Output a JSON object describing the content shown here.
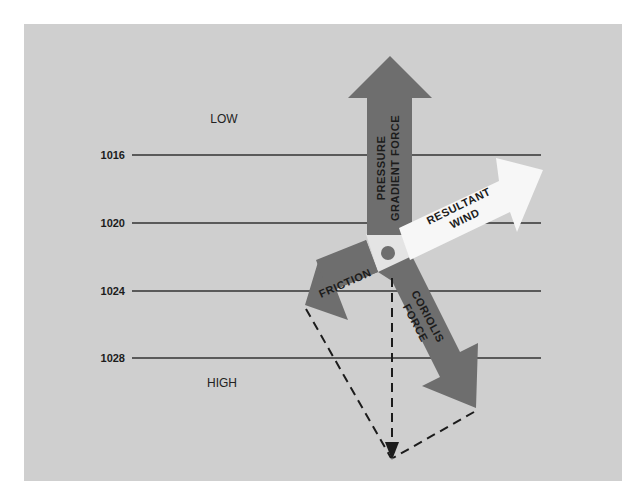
{
  "diagram": {
    "background_color": "#cfcfcf",
    "region_labels": {
      "low": "LOW",
      "high": "HIGH"
    },
    "isobars": [
      {
        "value": "1016",
        "y": 155
      },
      {
        "value": "1020",
        "y": 223
      },
      {
        "value": "1024",
        "y": 291
      },
      {
        "value": "1028",
        "y": 358
      }
    ],
    "arrows": {
      "pressure_gradient_force": {
        "line1": "PRESSURE",
        "line2": "GRADIENT FORCE",
        "color": "#6e6e6e"
      },
      "resultant_wind": {
        "line1": "RESULTANT",
        "line2": "WIND",
        "color": "#f7f7f7"
      },
      "friction": {
        "line1": "FRICTION",
        "color": "#6e6e6e"
      },
      "coriolis_force": {
        "line1": "CORIOLIS",
        "line2": "FORCE",
        "color": "#6e6e6e"
      }
    },
    "center_dot_color": "#6e6e6e"
  }
}
